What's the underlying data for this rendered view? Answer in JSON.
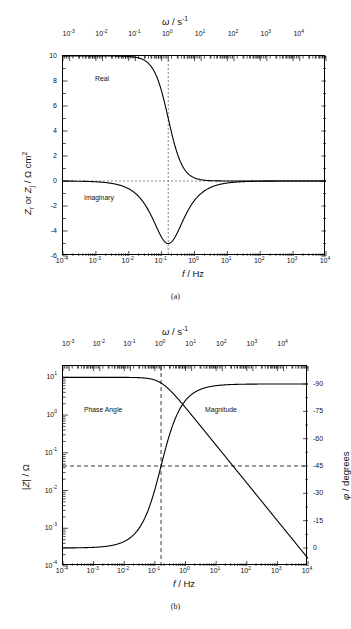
{
  "figure": {
    "panel_a_caption": "(a)",
    "panel_b_caption": "(b)"
  },
  "panel_a": {
    "top_axis_title": "ω / s",
    "top_axis_title_sup": "-1",
    "bottom_axis_title_italic": "f",
    "bottom_axis_title_rest": " / Hz",
    "y_axis_title": "Zᵣ or Zⱼ / Ω cm²",
    "top_ticks": [
      "10-3",
      "10-2",
      "10-1",
      "100",
      "101",
      "102",
      "103",
      "104"
    ],
    "top_tick_bases": [
      "10",
      "10",
      "10",
      "10",
      "10",
      "10",
      "10",
      "10"
    ],
    "top_tick_exps": [
      "-3",
      "-2",
      "-1",
      "0",
      "1",
      "2",
      "3",
      "4"
    ],
    "bottom_tick_exps": [
      "-4",
      "-3",
      "-2",
      "-1",
      "0",
      "1",
      "2",
      "3",
      "4"
    ],
    "y_ticks": [
      "10",
      "8",
      "6",
      "4",
      "2",
      "0",
      "-2",
      "-4",
      "-6"
    ],
    "annotations": [
      {
        "name": "real-curve-label",
        "text": "Real"
      },
      {
        "name": "imaginary-curve-label",
        "text": "Imaginary"
      }
    ]
  },
  "panel_b": {
    "top_axis_title": "ω / s",
    "top_axis_title_sup": "-1",
    "bottom_axis_title_italic": "f",
    "bottom_axis_title_rest": " / Hz",
    "y_axis_title_left": "|Z| / Ω",
    "y_axis_title_right": "φ / degrees",
    "top_tick_exps": [
      "-3",
      "-2",
      "-1",
      "0",
      "1",
      "2",
      "3",
      "4"
    ],
    "bottom_tick_exps": [
      "-4",
      "-3",
      "-2",
      "-1",
      "0",
      "1",
      "2",
      "3",
      "4"
    ],
    "y_tick_exps_left": [
      "1",
      "0",
      "-1",
      "-2",
      "-3",
      "-4"
    ],
    "y_ticks_right": [
      "-90",
      "-75",
      "-60",
      "-45",
      "-30",
      "-15",
      "0"
    ],
    "annotations": [
      {
        "name": "phase-angle-label",
        "text": "Phase Angle"
      },
      {
        "name": "magnitude-label",
        "text": "Magnitude"
      }
    ]
  },
  "chart_data": [
    {
      "type": "line",
      "id": "panel-a",
      "title": "",
      "xlabel": "f / Hz",
      "ylabel": "Z_r or Z_j / Ω cm^2",
      "x_scale": "log",
      "xlim": [
        0.0001,
        10000
      ],
      "ylim": [
        -6,
        10
      ],
      "x_ticks": [
        0.0001,
        0.001,
        0.01,
        0.1,
        1,
        10,
        100,
        1000,
        10000
      ],
      "y_ticks": [
        -6,
        -4,
        -2,
        0,
        2,
        4,
        6,
        8,
        10
      ],
      "secondary_x_axis": {
        "label": "ω / s^-1",
        "scale": "log",
        "lim": [
          0.000628,
          62800
        ],
        "ticks": [
          0.001,
          0.01,
          0.1,
          1,
          10,
          100,
          1000,
          10000
        ]
      },
      "grid": false,
      "legend": "inline-annotations",
      "reference_lines": [
        {
          "name": "zero-line",
          "orientation": "horizontal",
          "value": 0,
          "style": "dashed"
        },
        {
          "name": "characteristic-frequency-line",
          "orientation": "vertical",
          "value": 0.159,
          "style": "dashed"
        }
      ],
      "series": [
        {
          "name": "Real",
          "description": "Z_r = R / (1 + (2*pi*f*RC)^2) with R = 10 ohm cm^2",
          "x": [
            0.0001,
            0.001,
            0.0032,
            0.01,
            0.0178,
            0.0316,
            0.0562,
            0.1,
            0.159,
            0.2,
            0.316,
            0.562,
            1,
            1.78,
            3.16,
            10,
            100,
            1000,
            10000
          ],
          "y": [
            10.0,
            10.0,
            9.99,
            9.9,
            9.69,
            9.09,
            7.59,
            5.0,
            2.5,
            1.76,
            0.8,
            0.28,
            0.093,
            0.031,
            0.01,
            0.001,
            0.0,
            0.0,
            0.0
          ]
        },
        {
          "name": "Imaginary",
          "description": "Z_j = -R*(2*pi*f*RC) / (1 + (2*pi*f*RC)^2), minimum -5 at f = 0.159 Hz",
          "x": [
            0.0001,
            0.001,
            0.0032,
            0.01,
            0.0178,
            0.0316,
            0.0562,
            0.1,
            0.159,
            0.2,
            0.316,
            0.562,
            1,
            1.78,
            3.16,
            10,
            100,
            1000,
            10000
          ],
          "y": [
            0.0,
            -0.006,
            -0.2,
            -0.62,
            -1.08,
            -1.74,
            -2.93,
            -4.3,
            -5.0,
            -4.9,
            -4.2,
            -3.05,
            -1.92,
            -1.13,
            -0.63,
            -0.2,
            -0.02,
            -0.002,
            0.0
          ]
        }
      ],
      "annotations": [
        {
          "text": "Real",
          "x": 0.004,
          "y": 8.9
        },
        {
          "text": "Imaginary",
          "x": 0.004,
          "y": -2.3
        }
      ]
    },
    {
      "type": "line",
      "id": "panel-b",
      "title": "",
      "xlabel": "f / Hz",
      "ylabel": "|Z| / Ω",
      "ylabel_right": "φ / degrees",
      "x_scale": "log",
      "y_scale": "log",
      "xlim": [
        0.0001,
        10000
      ],
      "ylim": [
        0.0001,
        20
      ],
      "ylim_right": [
        0,
        -90
      ],
      "x_ticks": [
        0.0001,
        0.001,
        0.01,
        0.1,
        1,
        10,
        100,
        1000,
        10000
      ],
      "y_ticks": [
        0.0001,
        0.001,
        0.01,
        0.1,
        1,
        10
      ],
      "y_ticks_right": [
        0,
        -15,
        -30,
        -45,
        -60,
        -75,
        -90
      ],
      "secondary_x_axis": {
        "label": "ω / s^-1",
        "scale": "log",
        "lim": [
          0.000628,
          62800
        ],
        "ticks": [
          0.001,
          0.01,
          0.1,
          1,
          10,
          100,
          1000,
          10000
        ]
      },
      "grid": false,
      "legend": "inline-annotations",
      "reference_lines": [
        {
          "name": "phase-45-line",
          "orientation": "horizontal",
          "value": -45,
          "axis": "right",
          "style": "dashed"
        },
        {
          "name": "characteristic-frequency-line",
          "orientation": "vertical",
          "value": 0.159,
          "style": "dashed"
        }
      ],
      "series": [
        {
          "name": "Magnitude",
          "axis": "left",
          "description": "|Z| = R / sqrt(1 + (2*pi*f*RC)^2), R = 10 ohm, breakpoint at f = 0.159 Hz, slope -1 decade/decade",
          "x": [
            0.0001,
            0.001,
            0.01,
            0.0316,
            0.1,
            0.159,
            0.316,
            1,
            3.16,
            10,
            100,
            1000,
            10000
          ],
          "y": [
            10.0,
            10.0,
            9.95,
            9.6,
            8.47,
            7.07,
            4.47,
            1.56,
            0.5,
            0.159,
            0.0159,
            0.00159,
            0.000159
          ]
        },
        {
          "name": "Phase Angle",
          "axis": "right",
          "description": "phi = -arctan(2*pi*f*RC), goes from 0 deg at low f to -90 deg at high f, -45 deg at f = 0.159 Hz",
          "x": [
            0.0001,
            0.001,
            0.01,
            0.0316,
            0.1,
            0.159,
            0.316,
            1,
            3.16,
            10,
            100,
            1000,
            10000
          ],
          "y": [
            -0.04,
            -0.36,
            -3.6,
            -11.2,
            -32.1,
            -45.0,
            -63.3,
            -81.0,
            -87.1,
            -89.1,
            -89.9,
            -90.0,
            -90.0
          ]
        }
      ],
      "annotations": [
        {
          "text": "Phase Angle",
          "x": 0.004,
          "y_axis": "left",
          "y": 1.0
        },
        {
          "text": "Magnitude",
          "x": 3.0,
          "y_axis": "left",
          "y": 1.0
        }
      ]
    }
  ]
}
